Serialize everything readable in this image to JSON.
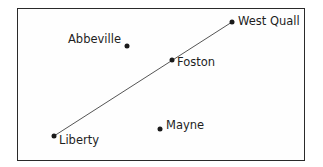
{
  "map": {
    "towns": [
      {
        "name": "West Quall",
        "x": 232,
        "y": 22,
        "label_x": 238,
        "label_y": 16
      },
      {
        "name": "Abbeville",
        "x": 127,
        "y": 46,
        "label_x": 68,
        "label_y": 34
      },
      {
        "name": "Foston",
        "x": 172,
        "y": 60,
        "label_x": 177,
        "label_y": 57
      },
      {
        "name": "Mayne",
        "x": 160,
        "y": 129,
        "label_x": 166,
        "label_y": 120
      },
      {
        "name": "Liberty",
        "x": 54,
        "y": 136,
        "label_x": 59,
        "label_y": 135
      }
    ],
    "routes": [
      {
        "from": "Liberty",
        "to": "West Quall",
        "via": "Foston",
        "color": "#555555"
      }
    ],
    "colors": {
      "border": "#2a2a2a",
      "dot": "#1a1a1a",
      "route": "#555555",
      "text": "#1e1e1e"
    }
  }
}
